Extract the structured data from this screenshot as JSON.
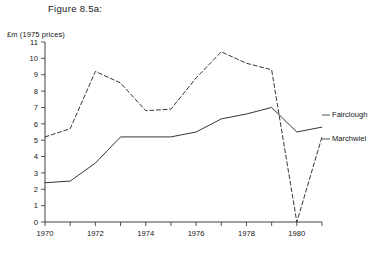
{
  "figure": {
    "title": "Figure 8.5a:",
    "unit_label": "£m (1975 prices)"
  },
  "series_labels": {
    "fairclough": "Fairclough",
    "marchwiel": "Marchwiel"
  },
  "chart_data": {
    "type": "line",
    "title": "Figure 8.5a:",
    "subtitle": "",
    "xlabel": "",
    "ylabel": "£m (1975 prices)",
    "x": [
      1970,
      1971,
      1972,
      1973,
      1974,
      1975,
      1976,
      1977,
      1978,
      1979,
      1980,
      1981
    ],
    "xtick_labels": [
      "1970",
      "",
      "1972",
      "",
      "1974",
      "",
      "1976",
      "",
      "1978",
      "",
      "1980",
      ""
    ],
    "ytick_labels": [
      "0",
      "1",
      "2",
      "3",
      "4",
      "5",
      "6",
      "7",
      "8",
      "9",
      "10",
      "11"
    ],
    "xlim": [
      1970,
      1981
    ],
    "ylim": [
      0,
      11
    ],
    "grid": false,
    "legend": "inline-right-labels",
    "series": [
      {
        "name": "Fairclough",
        "style": "solid",
        "values": [
          2.4,
          2.5,
          3.6,
          5.2,
          5.2,
          5.2,
          5.5,
          6.3,
          6.6,
          7.0,
          5.5,
          5.8
        ]
      },
      {
        "name": "Marchwiel",
        "style": "dashed",
        "values": [
          5.2,
          5.7,
          9.2,
          8.5,
          6.8,
          6.9,
          8.8,
          10.4,
          9.7,
          9.3,
          0.0,
          5.2
        ]
      }
    ]
  },
  "geometry": {
    "plot_left": 45,
    "plot_right": 322,
    "plot_top": 42,
    "plot_bottom": 222,
    "px_per_year": 25.2,
    "px_per_unit": 16.36
  },
  "colors": {
    "ink": "#2b2b2b",
    "background": "#ffffff"
  }
}
